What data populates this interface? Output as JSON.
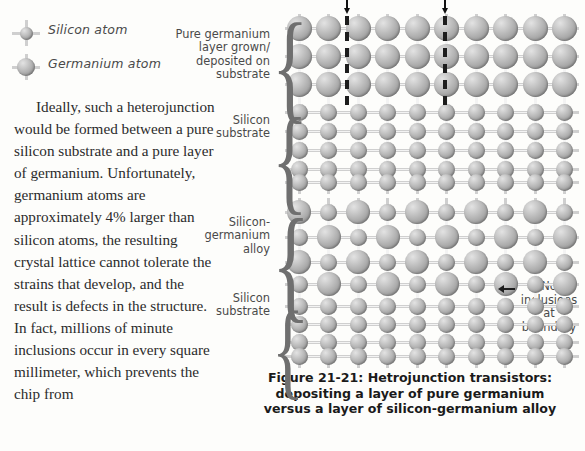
{
  "legend": {
    "items": [
      {
        "label": "Silicon atom",
        "size": 13,
        "icon": "silicon-atom-icon"
      },
      {
        "label": "Germanium atom",
        "size": 18,
        "icon": "germanium-atom-icon"
      }
    ]
  },
  "body": {
    "paragraph": "Ideally, such a heterojunction would be formed between a pure silicon substrate and a pure layer of germanium. Unfortunately, germanium atoms are approximately 4% larger than silicon atoms, the resulting crystal lattice cannot tolerate the strains that develop, and the result is defects in the structure. In fact, millions of minute inclusions occur in every square millimeter, which prevents the chip from"
  },
  "diagram_top": {
    "labels": {
      "germanium_layer": "Pure germanium\nlayer grown/\ndeposited on\nsubstrate",
      "silicon_substrate": "Silicon\nsubstrate"
    },
    "defect_markers": 2,
    "germanium_rows": 3,
    "silicon_rows": 5,
    "columns": 10
  },
  "diagram_bottom": {
    "labels": {
      "alloy": "Silicon-\ngermanium\nalloy",
      "silicon_substrate": "Silicon\nsubstrate"
    },
    "alloy_rows": 4,
    "silicon_rows": 5,
    "columns": 10
  },
  "annotation": {
    "text": "No\ninclusions\nat boundary",
    "arrow": "left-arrow-icon"
  },
  "caption": {
    "line1": "Figure 21-21: Hetrojunction transistors:",
    "line2": "depositing a layer of pure germanium",
    "line3": "versus a layer of silicon-germanium alloy"
  },
  "colors": {
    "atom_fill": "#a9a9a9",
    "bond": "#bfbfbf",
    "defect_line": "#1d1d1d",
    "text": "#2b2b2b",
    "label_text": "#4a4a4a"
  }
}
